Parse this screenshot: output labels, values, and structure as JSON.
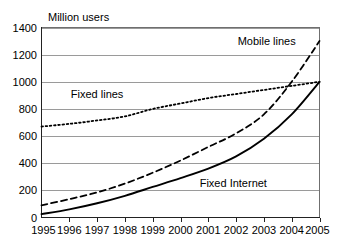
{
  "chart_data": {
    "type": "line",
    "title": "",
    "subtitle": "",
    "xlabel": "",
    "ylabel": "Million users",
    "ylabel_position": "above-axis",
    "x": [
      1995,
      1996,
      1997,
      1998,
      1999,
      2000,
      2001,
      2002,
      2003,
      2004,
      2005
    ],
    "categories": [
      "1995",
      "1996",
      "1997",
      "1998",
      "1999",
      "2000",
      "2001",
      "2002",
      "2003",
      "2004",
      "2005"
    ],
    "xlim": [
      1995,
      2005
    ],
    "ylim": [
      0,
      1400
    ],
    "yticks": [
      0,
      200,
      400,
      600,
      800,
      1000,
      1200,
      1400
    ],
    "ytick_labels": [
      "0",
      "200",
      "400",
      "600",
      "800",
      "1000",
      "1200",
      "1400"
    ],
    "xtick_labels": [
      "1995",
      "1996",
      "1997",
      "1998",
      "1999",
      "2000",
      "2001",
      "2002",
      "2003",
      "2004",
      "2005"
    ],
    "grid": true,
    "grid_axis": "y",
    "legend": "inline-labels",
    "legend_position": "inline",
    "series": [
      {
        "name": "Fixed lines",
        "style": "dotted",
        "color": "#000000",
        "label_x": 1997.0,
        "label_y": 880,
        "values": [
          670,
          690,
          715,
          745,
          800,
          840,
          880,
          910,
          940,
          970,
          1000
        ]
      },
      {
        "name": "Mobile lines",
        "style": "dashed",
        "color": "#000000",
        "label_x": 2003.1,
        "label_y": 1270,
        "values": [
          90,
          135,
          185,
          250,
          330,
          420,
          520,
          620,
          760,
          1000,
          1300
        ]
      },
      {
        "name": "Fixed Internet",
        "style": "solid",
        "color": "#000000",
        "label_x": 2001.9,
        "label_y": 225,
        "values": [
          25,
          60,
          105,
          160,
          225,
          290,
          360,
          450,
          580,
          760,
          1000
        ]
      }
    ],
    "annotations": [
      {
        "text": "Fixed lines",
        "series": "Fixed lines"
      },
      {
        "text": "Mobile lines",
        "series": "Mobile lines"
      },
      {
        "text": "Fixed Internet",
        "series": "Fixed Internet"
      }
    ],
    "colors": {
      "background": "#ffffff",
      "gridline": "#9a9a9a",
      "axis": "#222222",
      "series": "#000000"
    }
  }
}
